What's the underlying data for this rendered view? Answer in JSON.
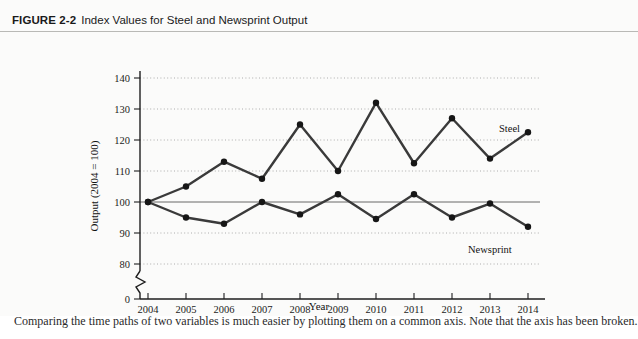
{
  "figure": {
    "label": "FIGURE 2-2",
    "caption": "Index Values for Steel and Newsprint Output"
  },
  "footer": {
    "partial_text": "Comparing the time paths of two variables is much easier by plotting them on a common axis. Note that the axis has been broken."
  },
  "chart_data": {
    "type": "line",
    "title": "Index Values for Steel and Newsprint Output",
    "xlabel": "Year",
    "ylabel": "Output (2004 = 100)",
    "categories": [
      "2004",
      "2005",
      "2006",
      "2007",
      "2008",
      "2009",
      "2010",
      "2011",
      "2012",
      "2013",
      "2014"
    ],
    "x": [
      2004,
      2005,
      2006,
      2007,
      2008,
      2009,
      2010,
      2011,
      2012,
      2013,
      2014
    ],
    "series": [
      {
        "name": "Steel",
        "values": [
          100,
          105,
          113,
          107.5,
          125,
          110,
          132,
          112.5,
          127,
          114,
          122.5
        ]
      },
      {
        "name": "Newsprint",
        "values": [
          100,
          95,
          93,
          100,
          96,
          102.5,
          94.5,
          102.5,
          95,
          99.5,
          92
        ]
      }
    ],
    "ytick_labels": [
      "0",
      "80",
      "90",
      "100",
      "110",
      "120",
      "130",
      "140"
    ],
    "ytick_values": [
      0,
      80,
      90,
      100,
      110,
      120,
      130,
      140
    ],
    "ylim": [
      80,
      140
    ],
    "axis_break": true,
    "axis_break_note": "y-axis broken between 0 and 80",
    "grid": "horizontal-dotted",
    "reference_line": 100,
    "legend": "inline-labels",
    "annotations": [
      {
        "text": "Steel",
        "series": "Steel",
        "near_x": 2013
      },
      {
        "text": "Newsprint",
        "series": "Newsprint",
        "near_x": 2013
      }
    ],
    "colors": {
      "line": "#3a3a3a",
      "marker": "#161616",
      "grid": "#9a9a9a",
      "axis": "#1e1e1e",
      "background": "#fbfbfa"
    }
  }
}
